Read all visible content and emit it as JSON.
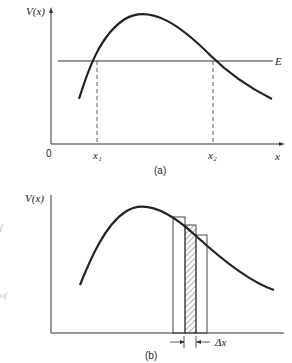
{
  "figure_a": {
    "y_axis_label": "V(x)",
    "x_axis_label": "x",
    "origin_label": "0",
    "energy_label": "E",
    "turning_points": [
      "x₁",
      "x₂"
    ],
    "caption": "(a)"
  },
  "figure_b": {
    "y_axis_label": "V(x)",
    "delta_label": "Δx",
    "caption": "(b)"
  },
  "margin_fragments": [
    "f",
    "of"
  ],
  "colors": {
    "ink": "#222222",
    "background": "#ffffff"
  }
}
